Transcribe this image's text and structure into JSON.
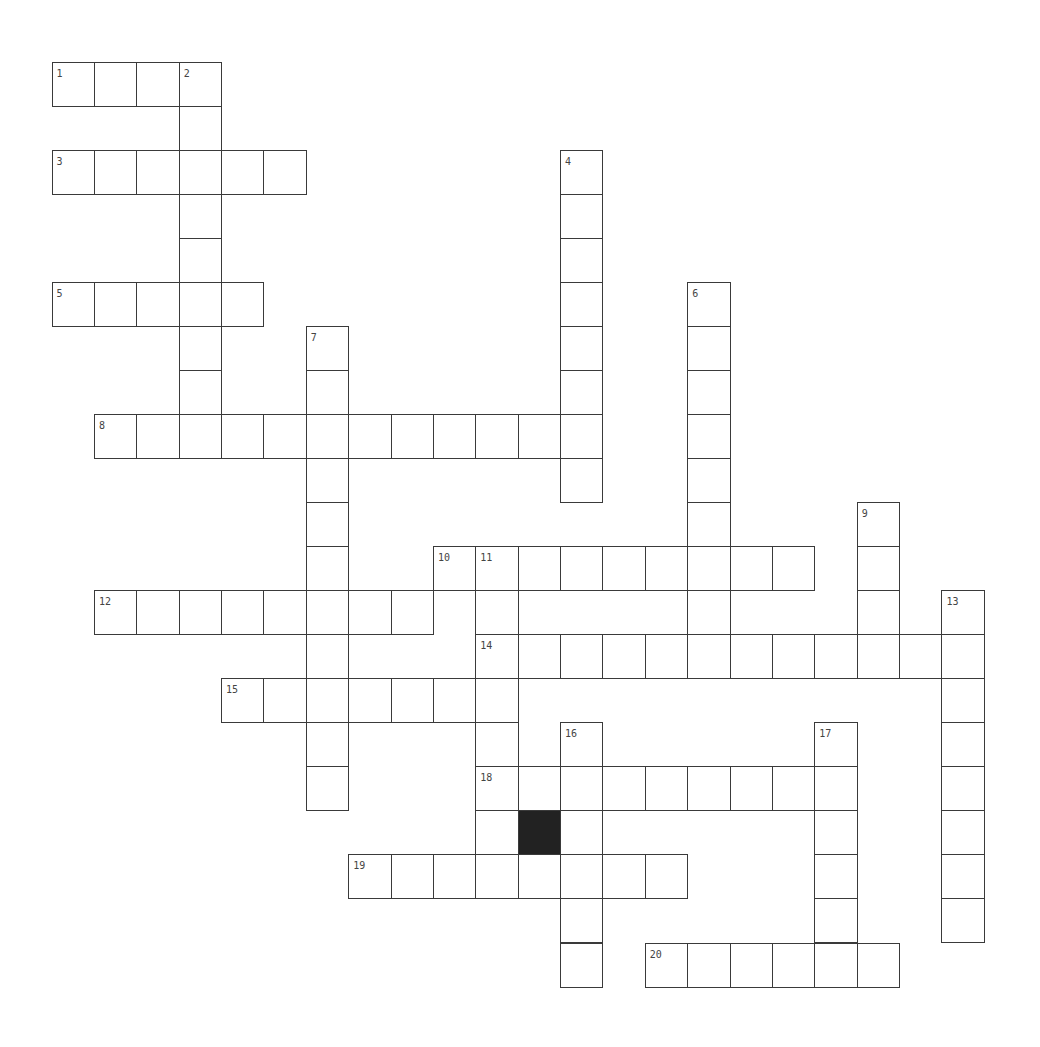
{
  "puzzle": {
    "cols": 22,
    "rows": 21,
    "colors": {
      "line": "#3a3a3a",
      "block": "#222222",
      "number": "#444444",
      "background": "#ffffff"
    },
    "entries": [
      {
        "number": "1",
        "direction": "across",
        "col": 0,
        "row": 0,
        "length": 4
      },
      {
        "number": "2",
        "direction": "down",
        "col": 3,
        "row": 0,
        "length": 9
      },
      {
        "number": "3",
        "direction": "across",
        "col": 0,
        "row": 2,
        "length": 6
      },
      {
        "number": "4",
        "direction": "down",
        "col": 12,
        "row": 2,
        "length": 8
      },
      {
        "number": "5",
        "direction": "across",
        "col": 0,
        "row": 5,
        "length": 5
      },
      {
        "number": "6",
        "direction": "down",
        "col": 15,
        "row": 5,
        "length": 9
      },
      {
        "number": "7",
        "direction": "down",
        "col": 6,
        "row": 6,
        "length": 11
      },
      {
        "number": "8",
        "direction": "across",
        "col": 1,
        "row": 8,
        "length": 12
      },
      {
        "number": "9",
        "direction": "down",
        "col": 19,
        "row": 10,
        "length": 4
      },
      {
        "number": "10",
        "direction": "across",
        "col": 9,
        "row": 11,
        "length": 9
      },
      {
        "number": "11",
        "direction": "down",
        "col": 10,
        "row": 11,
        "length": 8
      },
      {
        "number": "12",
        "direction": "across",
        "col": 1,
        "row": 12,
        "length": 8
      },
      {
        "number": "13",
        "direction": "down",
        "col": 21,
        "row": 12,
        "length": 8
      },
      {
        "number": "14",
        "direction": "across",
        "col": 10,
        "row": 13,
        "length": 12
      },
      {
        "number": "15",
        "direction": "across",
        "col": 4,
        "row": 14,
        "length": 7
      },
      {
        "number": "16",
        "direction": "down",
        "col": 12,
        "row": 15,
        "length": 6
      },
      {
        "number": "17",
        "direction": "down",
        "col": 18,
        "row": 15,
        "length": 6
      },
      {
        "number": "18",
        "direction": "across",
        "col": 10,
        "row": 16,
        "length": 9
      },
      {
        "number": "19",
        "direction": "across",
        "col": 7,
        "row": 18,
        "length": 8
      },
      {
        "number": "20",
        "direction": "across",
        "col": 14,
        "row": 20,
        "length": 6
      }
    ],
    "black_cells": [
      {
        "col": 11,
        "row": 17
      }
    ]
  }
}
